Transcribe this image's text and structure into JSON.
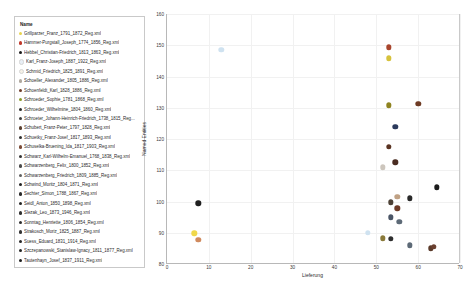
{
  "legend": {
    "title": "Name",
    "items": [
      {
        "label": "Grillparzer_Franz_1791_1872_Reg.xml",
        "color": "#e8d44d"
      },
      {
        "label": "Hammer-Purgstall_Joseph_1774_1856_Reg.xml",
        "color": "#c0392b"
      },
      {
        "label": "Hebbel_Christian-Friedrich_1813_1863_Reg.xml",
        "color": "#1a1a1a"
      },
      {
        "label": "Karl_Franz-Joseph_1887_1922_Reg.xml",
        "color": "#e8eef5"
      },
      {
        "label": "Schmid_Friedrich_1825_1891_Reg.xml",
        "color": "#f5f0e6"
      },
      {
        "label": "Schoeller_Alexander_1805_1886_Reg.xml",
        "color": "#b0a9a0"
      },
      {
        "label": "Schoenfeldt_Karl_1828_1886_Reg.xml",
        "color": "#6e3b2a"
      },
      {
        "label": "Schroeder_Sophie_1781_1868_Reg.xml",
        "color": "#8a9a2c"
      },
      {
        "label": "Schroeder_Wilhelmine_1804_1860_Reg.xml",
        "color": "#2b2b2b"
      },
      {
        "label": "Schroeter_Johann-Heinrich-Friedrich_1738_1815_Reg...",
        "color": "#3d3d3d"
      },
      {
        "label": "Schubert_Franz-Peter_1797_1828_Reg.xml",
        "color": "#5a4030"
      },
      {
        "label": "Schuetky_Franz-Josef_1817_1893_Reg.xml",
        "color": "#2f2f2f"
      },
      {
        "label": "Schuselka-Bruening_Ida_1817_1903_Reg.xml",
        "color": "#7a4a36"
      },
      {
        "label": "Schwarz_Karl-Wilhelm-Emanuel_1768_1838_Reg.xml",
        "color": "#333333"
      },
      {
        "label": "Schwarzenberg_Felix_1800_1852_Reg.xml",
        "color": "#4a4a4a"
      },
      {
        "label": "Schwarzenberg_Friedrich_1809_1885_Reg.xml",
        "color": "#5f5f5f"
      },
      {
        "label": "Schwind_Moritz_1804_1871_Reg.xml",
        "color": "#222222"
      },
      {
        "label": "Sechter_Simon_1788_1867_Reg.xml",
        "color": "#2a2a2a"
      },
      {
        "label": "Seidl_Anton_1850_1898_Reg.xml",
        "color": "#252525"
      },
      {
        "label": "Slezak_Leo_1873_1946_Reg.xml",
        "color": "#303030"
      },
      {
        "label": "Sonntag_Henriette_1806_1854_Reg.xml",
        "color": "#2d2d2d"
      },
      {
        "label": "Strakosch_Moriz_1825_1887_Reg.xml",
        "color": "#343434"
      },
      {
        "label": "Suess_Eduard_1831_1914_Reg.xml",
        "color": "#282828"
      },
      {
        "label": "Szczepanowski_Stanislaw-Ignacy_1811_1877_Reg.xml",
        "color": "#262626"
      },
      {
        "label": "Tautenhayn_Josef_1837_1911_Reg.xml",
        "color": "#1f1f1f"
      }
    ]
  },
  "chart_data": {
    "type": "scatter",
    "title": "",
    "xlabel": "Lieferung",
    "ylabel": "Named Entities",
    "xlim": [
      0,
      70
    ],
    "ylim": [
      80,
      160
    ],
    "xticks": [
      0,
      10,
      20,
      30,
      40,
      50,
      60,
      70
    ],
    "yticks": [
      80,
      90,
      100,
      110,
      120,
      130,
      140,
      150,
      160
    ],
    "grid": true,
    "legend_position": "left-panel",
    "points": [
      {
        "name": "Karl_Franz-Joseph_1887_1922_Reg.xml",
        "x": 13,
        "y": 148.5,
        "color": "#cfe2f0"
      },
      {
        "name": "Hammer-Purgstall_Joseph_1774_1856_Reg.xml",
        "x": 53,
        "y": 149.3,
        "color": "#a8452c"
      },
      {
        "name": "Grillparzer_Franz_1791_1872_Reg.xml",
        "x": 53,
        "y": 145.8,
        "color": "#d6c23c"
      },
      {
        "name": "Schroeder_Sophie_1781_1868_Reg.xml",
        "x": 53,
        "y": 130.8,
        "color": "#8f8320"
      },
      {
        "name": "Schoenfeldt_Karl_1828_1886_Reg.xml",
        "x": 60,
        "y": 131.3,
        "color": "#6e3b24"
      },
      {
        "name": "Schwarzenberg_Felix_1800_1852_Reg.xml",
        "x": 54.5,
        "y": 124.0,
        "color": "#2b3a5c"
      },
      {
        "name": "Schubert_Franz-Peter_1797_1828_Reg.xml",
        "x": 53,
        "y": 117.5,
        "color": "#5a3322"
      },
      {
        "name": "Schwarz_Karl-Wilhelm-Emanuel_1768_1838_Reg.xml",
        "x": 54.5,
        "y": 112.5,
        "color": "#4a2c22"
      },
      {
        "name": "Schmid_Friedrich_1825_1891_Reg.xml",
        "x": 51.5,
        "y": 111.0,
        "color": "#cdc6bd"
      },
      {
        "name": "Slezak_Leo_1873_1946_Reg.xml",
        "x": 64.5,
        "y": 104.5,
        "color": "#1c1c1c"
      },
      {
        "name": "Schwind_Moritz_1804_1871_Reg.xml",
        "x": 58,
        "y": 101.0,
        "color": "#2a2a2a"
      },
      {
        "name": "Schoeller_Alexander_1805_1886_Reg.xml",
        "x": 55,
        "y": 101.6,
        "color": "#c0a184"
      },
      {
        "name": "Schuselka-Bruening_Ida_1817_1903_Reg.xml",
        "x": 53.5,
        "y": 99.7,
        "color": "#4d4136"
      },
      {
        "name": "Hebbel_Christian-Friedrich_1813_1863_Reg.xml",
        "x": 7.5,
        "y": 99.4,
        "color": "#1f1f1f"
      },
      {
        "name": "Schroeter_Johann-Heinrich-Friedrich_1738_1815_Reg...",
        "x": 55,
        "y": 97.8,
        "color": "#6e3b28"
      },
      {
        "name": "Schwarzenberg_Friedrich_1809_1885_Reg.xml",
        "x": 53.5,
        "y": 95.0,
        "color": "#4a5566"
      },
      {
        "name": "Schroeder_Wilhelmine_1804_1860_Reg.xml",
        "x": 55.5,
        "y": 93.5,
        "color": "#5d6a77"
      },
      {
        "name": "Sonntag_Henriette_1806_1854_Reg.xml",
        "x": 6.5,
        "y": 89.8,
        "color": "#f0d84a"
      },
      {
        "name": "Sechter_Simon_1788_1867_Reg.xml",
        "x": 48,
        "y": 90.0,
        "color": "#cfe2f0"
      },
      {
        "name": "Strakosch_Moriz_1825_1887_Reg.xml",
        "x": 7.5,
        "y": 87.8,
        "color": "#d08a5e"
      },
      {
        "name": "Schuetky_Franz-Josef_1817_1893_Reg.xml",
        "x": 51.5,
        "y": 88.2,
        "color": "#8a7a3a"
      },
      {
        "name": "Seidl_Anton_1850_1898_Reg.xml",
        "x": 53.5,
        "y": 88.0,
        "color": "#2e2e2e"
      },
      {
        "name": "Suess_Eduard_1831_1914_Reg.xml",
        "x": 58,
        "y": 86.0,
        "color": "#5d6a77"
      },
      {
        "name": "Szczepanowski_Stanislaw-Ignacy_1811_1877_Reg.xml",
        "x": 63,
        "y": 85.0,
        "color": "#5a3a2a"
      },
      {
        "name": "Tautenhayn_Josef_1837_1911_Reg.xml",
        "x": 63.8,
        "y": 85.6,
        "color": "#6b4030"
      }
    ]
  }
}
